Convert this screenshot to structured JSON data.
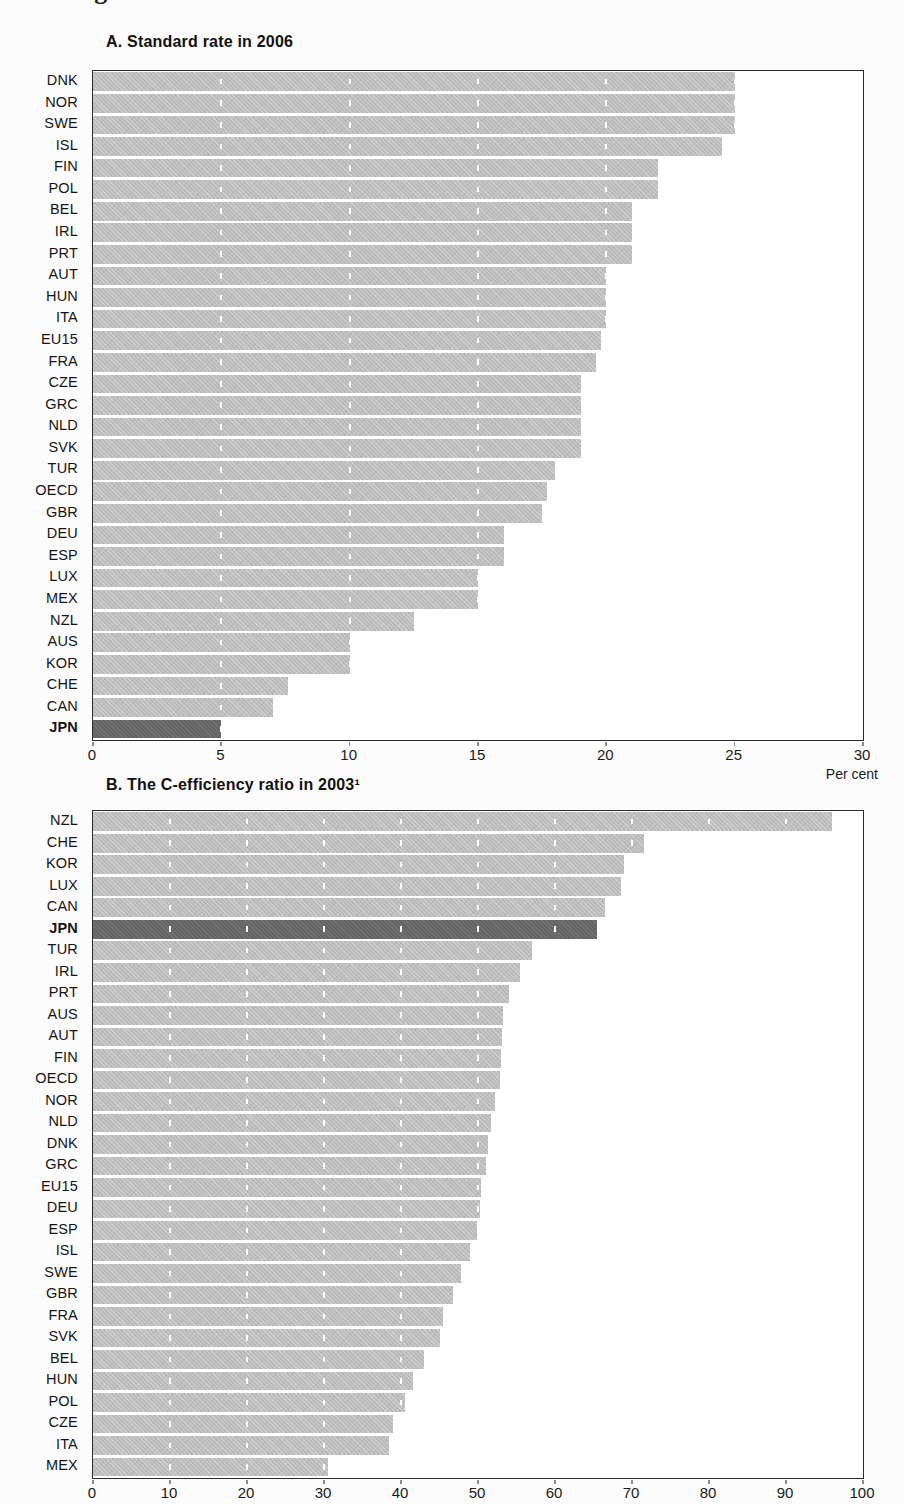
{
  "figure": {
    "cropped_title": "Figure 3.9. Value-added taxes in OECD countries"
  },
  "colors": {
    "bar": "#bdbdbd",
    "bar_highlight": "#646464",
    "gridline": "#ffffff",
    "frame": "#2b2b2b"
  },
  "chart_data": [
    {
      "type": "bar",
      "orientation": "horizontal",
      "title": "A. Standard rate in 2006",
      "xlabel": "Per cent",
      "xlim": [
        0,
        30
      ],
      "xticks": [
        0,
        5,
        10,
        15,
        20,
        25,
        30
      ],
      "grid": "white dashed vertical lines over bars",
      "highlight": "JPN",
      "categories": [
        "DNK",
        "NOR",
        "SWE",
        "ISL",
        "FIN",
        "POL",
        "BEL",
        "IRL",
        "PRT",
        "AUT",
        "HUN",
        "ITA",
        "EU15",
        "FRA",
        "CZE",
        "GRC",
        "NLD",
        "SVK",
        "TUR",
        "OECD",
        "GBR",
        "DEU",
        "ESP",
        "LUX",
        "MEX",
        "NZL",
        "AUS",
        "KOR",
        "CHE",
        "CAN",
        "JPN"
      ],
      "values": [
        25,
        25,
        25,
        24.5,
        22,
        22,
        21,
        21,
        21,
        20,
        20,
        20,
        19.8,
        19.6,
        19,
        19,
        19,
        19,
        18,
        17.7,
        17.5,
        16,
        16,
        15,
        15,
        12.5,
        10,
        10,
        7.6,
        7,
        5
      ]
    },
    {
      "type": "bar",
      "orientation": "horizontal",
      "title": "B. The C-efficiency ratio in 2003¹",
      "xlabel": "",
      "xlim": [
        0,
        100
      ],
      "xticks": [
        0,
        10,
        20,
        30,
        40,
        50,
        60,
        70,
        80,
        90,
        100
      ],
      "grid": "white dashed vertical lines over bars",
      "highlight": "JPN",
      "categories": [
        "NZL",
        "CHE",
        "KOR",
        "LUX",
        "CAN",
        "JPN",
        "TUR",
        "IRL",
        "PRT",
        "AUS",
        "AUT",
        "FIN",
        "OECD",
        "NOR",
        "NLD",
        "DNK",
        "GRC",
        "EU15",
        "DEU",
        "ESP",
        "ISL",
        "SWE",
        "GBR",
        "FRA",
        "SVK",
        "BEL",
        "HUN",
        "POL",
        "CZE",
        "ITA",
        "MEX"
      ],
      "values": [
        96,
        71.5,
        69,
        68.5,
        66.5,
        65.5,
        57,
        55.5,
        54,
        53.2,
        53.1,
        53,
        52.8,
        52.2,
        51.7,
        51.3,
        51,
        50.4,
        50.3,
        49.8,
        49,
        47.8,
        46.8,
        45.5,
        45,
        43,
        41.5,
        40.5,
        39,
        38.5,
        30.5
      ]
    }
  ]
}
